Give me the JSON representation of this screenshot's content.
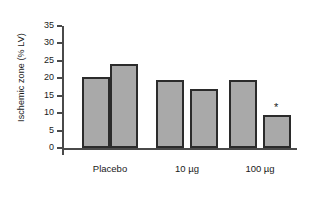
{
  "chart_data": {
    "type": "bar",
    "title": "",
    "xlabel": "",
    "ylabel": "Ischemic zone (% LV)",
    "ylim": [
      0,
      35
    ],
    "yticks": [
      0,
      5,
      10,
      15,
      20,
      25,
      30,
      35
    ],
    "ytick_labels": [
      "0",
      "5",
      "10",
      "15",
      "20",
      "25",
      "30",
      "35"
    ],
    "grid": false,
    "legend": null,
    "categories": [
      "Placebo",
      "10 µg",
      "100 µg"
    ],
    "series": [
      {
        "name": "Risk zone",
        "values": [
          20.5,
          19.5,
          19.5
        ]
      },
      {
        "name": "Infarct zone",
        "values": [
          24.0,
          17.0,
          9.5
        ]
      }
    ],
    "bars": [
      {
        "group": "Placebo",
        "series": "Risk zone",
        "value": 20.5,
        "annotation": ""
      },
      {
        "group": "Placebo",
        "series": "Infarct zone",
        "value": 24.0,
        "annotation": ""
      },
      {
        "group": "10 µg",
        "series": "Risk zone",
        "value": 19.5,
        "annotation": ""
      },
      {
        "group": "10 µg",
        "series": "Infarct zone",
        "value": 17.0,
        "annotation": ""
      },
      {
        "group": "100 µg",
        "series": "Risk zone",
        "value": 19.5,
        "annotation": ""
      },
      {
        "group": "100 µg",
        "series": "Infarct zone",
        "value": 9.5,
        "annotation": "*"
      }
    ],
    "annotations": [
      {
        "text": "*",
        "group": "100 µg",
        "series": "Infarct zone",
        "y": 13.0
      }
    ],
    "colors": {
      "bar_fill": "#a9a9a9",
      "bar_edge": "#2b2b2b",
      "axis": "#4a4a4a",
      "text": "#1a1a1a",
      "background": "#ffffff"
    }
  }
}
